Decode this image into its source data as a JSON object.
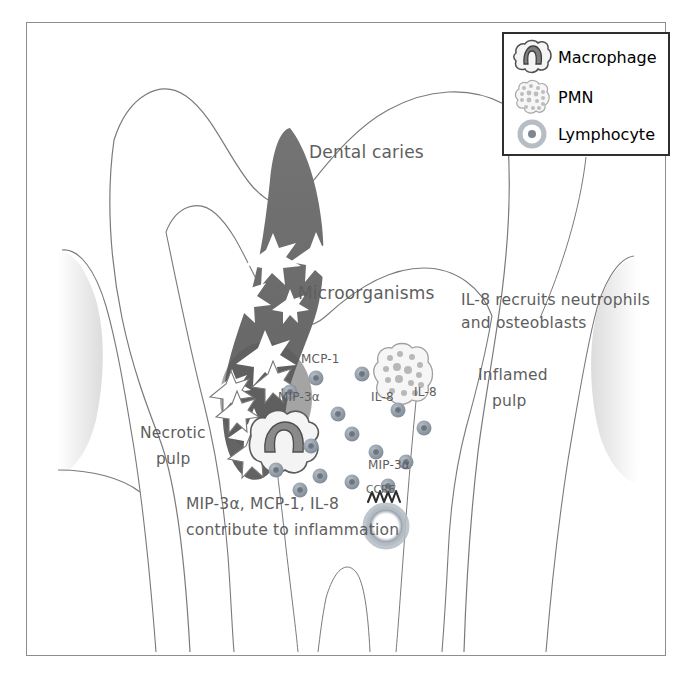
{
  "figure": {
    "type": "diagram",
    "background": "#ffffff",
    "border_color": "#8d8d8d"
  },
  "legend": {
    "title": "",
    "border_color": "#2f2f2f",
    "items": [
      {
        "icon": "macrophage-icon",
        "label": "Macrophage"
      },
      {
        "icon": "pmn-icon",
        "label": "PMN"
      },
      {
        "icon": "lymphocyte-icon",
        "label": "Lymphocyte"
      }
    ]
  },
  "annotations": {
    "dental_caries": "Dental caries",
    "microorganisms": "Microorganisms",
    "il8_recruits_line1": "IL-8 recruits neutrophils",
    "il8_recruits_line2": "and osteoblasts",
    "inflamed_pulp_line1": "Inflamed",
    "inflamed_pulp_line2": "pulp",
    "necrotic_pulp_line1": "Necrotic",
    "necrotic_pulp_line2": "pulp",
    "contribute_line1": "MIP-3α, MCP-1, IL-8",
    "contribute_line2": "contribute to inflammation",
    "mcp1": "MCP-1",
    "mip3a_upper": "MIP-3α",
    "mip3a_lower": "MIP-3α",
    "il8_a": "IL-8",
    "il8_b": "IL-8",
    "ccr6": "CCR6"
  },
  "colors": {
    "caries_fill": "#6f6f6f",
    "caries_fill_dark": "#5c5c5c",
    "outline": "#6d6d6d",
    "text": "#5e5e5e",
    "lymphocyte_fill": "#9aa3ae",
    "lymphocyte_core": "#6f7782",
    "gingiva": "#e3e3e3",
    "macrophage_nucleus": "#7d7d7d",
    "pmn_fill": "#f2f2f2"
  },
  "cells": {
    "lymphocytes": [
      {
        "x": 316,
        "y": 378,
        "r": 7
      },
      {
        "x": 362,
        "y": 374,
        "r": 7
      },
      {
        "x": 290,
        "y": 392,
        "r": 7
      },
      {
        "x": 338,
        "y": 414,
        "r": 7
      },
      {
        "x": 398,
        "y": 410,
        "r": 7
      },
      {
        "x": 424,
        "y": 428,
        "r": 7
      },
      {
        "x": 352,
        "y": 434,
        "r": 7
      },
      {
        "x": 311,
        "y": 446,
        "r": 7
      },
      {
        "x": 376,
        "y": 452,
        "r": 7
      },
      {
        "x": 406,
        "y": 462,
        "r": 7
      },
      {
        "x": 276,
        "y": 470,
        "r": 7
      },
      {
        "x": 320,
        "y": 476,
        "r": 7
      },
      {
        "x": 352,
        "y": 482,
        "r": 7
      },
      {
        "x": 300,
        "y": 490,
        "r": 7
      },
      {
        "x": 388,
        "y": 486,
        "r": 7
      }
    ],
    "macrophage": {
      "x": 283,
      "y": 442
    },
    "pmn": {
      "x": 404,
      "y": 374
    },
    "ccr6_lymphocyte": {
      "x": 386,
      "y": 526
    },
    "microorganism_stars_in_lesion": 7,
    "microorganism_stars_escaping": 4
  }
}
